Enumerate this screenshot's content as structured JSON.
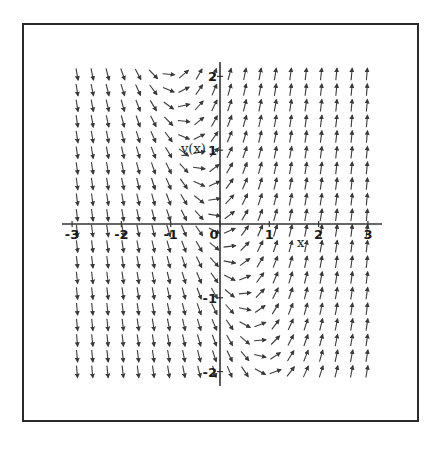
{
  "chart_data": {
    "type": "direction_field",
    "title": "",
    "equation": "dy/dx = 2x + y",
    "xlabel": "x",
    "ylabel": "y(x)",
    "xlim": [
      -3,
      3
    ],
    "ylim": [
      -2,
      2
    ],
    "x_ticks": [
      -3,
      -2,
      -1,
      0,
      1,
      2,
      3
    ],
    "x_tick_labels": [
      "-3",
      "-2",
      "-1",
      "0",
      "1",
      "2",
      "3"
    ],
    "y_ticks": [
      -2,
      -1,
      1,
      2
    ],
    "y_tick_labels": [
      "-2",
      "-1",
      "1",
      "2"
    ],
    "grid": false,
    "legend": null,
    "arrow_grid": {
      "columns": 20,
      "rows": 20,
      "x_range": [
        -2.9,
        2.98
      ],
      "y_range": [
        -2.0,
        2.03
      ],
      "arrow_length_px": 12
    },
    "observations": [
      {
        "x": -3,
        "y": 2,
        "slope": "steep negative"
      },
      {
        "x": -1,
        "y": 2,
        "slope": "zero"
      },
      {
        "x": 0,
        "y": 0,
        "slope": "zero"
      },
      {
        "x": 1,
        "y": -2,
        "slope": "zero"
      },
      {
        "x": 3,
        "y": -2,
        "slope": "steep positive"
      },
      {
        "x": 3,
        "y": 2,
        "slope": "steep positive"
      }
    ]
  },
  "colors": {
    "background": "#ffffff",
    "frame": "#2a2a2a",
    "axis": "#333333",
    "arrow": "#3a3a3a",
    "text": "#1a1a1a"
  },
  "layout": {
    "origin_px": [
      220,
      224
    ],
    "x_px_per_unit": 49.3,
    "y_px_per_unit": 73.8,
    "x_axis_px_extent": [
      62,
      382
    ],
    "y_axis_px_extent": [
      62,
      386
    ],
    "xlabel_px": [
      297,
      247
    ],
    "ylabel_px": [
      181,
      153
    ]
  }
}
